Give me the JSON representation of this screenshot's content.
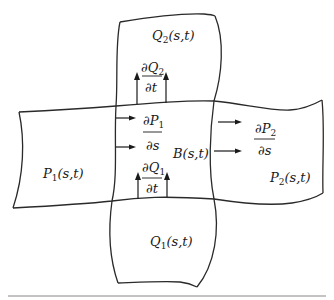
{
  "diagram": {
    "type": "surface-patch-blending",
    "regions": {
      "top": {
        "name": "Q",
        "sub": "2",
        "args": "(s,t)"
      },
      "bottom": {
        "name": "Q",
        "sub": "1",
        "args": "(s,t)"
      },
      "left": {
        "name": "P",
        "sub": "1",
        "args": "(s,t)"
      },
      "right": {
        "name": "P",
        "sub": "2",
        "args": "(s,t)"
      },
      "center": {
        "name": "B",
        "args": "(s,t)"
      }
    },
    "derivatives": {
      "dQ2_dt": {
        "num_d": "∂",
        "num_var": "Q",
        "num_sub": "2",
        "den": "∂t"
      },
      "dP1_ds": {
        "num_d": "∂",
        "num_var": "P",
        "num_sub": "1",
        "den": "∂s"
      },
      "dQ1_dt": {
        "num_d": "∂",
        "num_var": "Q",
        "num_sub": "1",
        "den": "∂t"
      },
      "dP2_ds": {
        "num_d": "∂",
        "num_var": "P",
        "num_sub": "2",
        "den": "∂s"
      }
    },
    "colors": {
      "stroke": "#2a2a2a",
      "rule": "#888888",
      "background": "#ffffff"
    }
  }
}
